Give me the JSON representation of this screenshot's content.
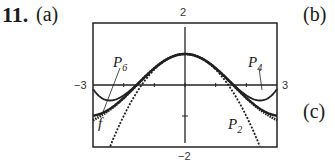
{
  "problem": {
    "number": "11.",
    "parts": [
      "(a)",
      "(b)",
      "(c)"
    ]
  },
  "chart_data": {
    "type": "line",
    "title": "",
    "xlabel": "",
    "ylabel": "",
    "xlim": [
      -3,
      3
    ],
    "ylim": [
      -2,
      2
    ],
    "tick_labels": {
      "xmin": "−3",
      "xmax": "3",
      "ymax": "2",
      "ymin": "−2"
    },
    "grid": false,
    "series": [
      {
        "name": "f",
        "label": "f",
        "function": "cos(x)"
      },
      {
        "name": "P2",
        "label": "P2",
        "function": "1 - x^2/2"
      },
      {
        "name": "P4",
        "label": "P4",
        "function": "1 - x^2/2 + x^4/24"
      },
      {
        "name": "P6",
        "label": "P6",
        "function": "1 - x^2/2 + x^4/24 - x^6/720"
      }
    ]
  }
}
